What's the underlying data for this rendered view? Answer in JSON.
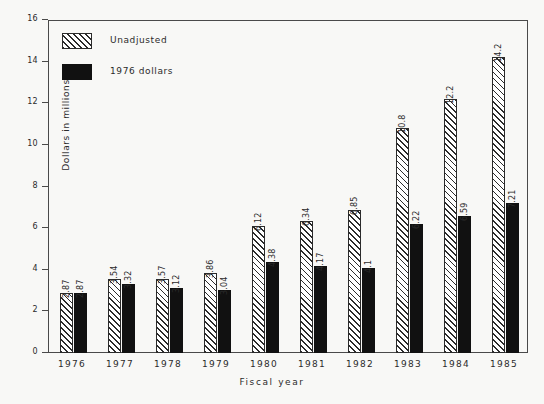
{
  "chart_data": {
    "type": "bar",
    "title": "",
    "xlabel": "Fiscal year",
    "ylabel": "Dollars in millions",
    "ylim": [
      0,
      16
    ],
    "yticks": [
      0,
      2,
      4,
      6,
      8,
      10,
      12,
      14,
      16
    ],
    "ytick_labels": [
      "0",
      "2",
      "4",
      "6",
      "8",
      "10",
      "12",
      "14",
      "16"
    ],
    "grid": false,
    "legend_position": "top-left",
    "categories": [
      "1976",
      "1977",
      "1978",
      "1979",
      "1980",
      "1981",
      "1982",
      "1983",
      "1984",
      "1985"
    ],
    "series": [
      {
        "name": "Unadjusted",
        "color": "#ffffff",
        "pattern": "diagonal-hatch",
        "values": [
          2.87,
          3.54,
          3.57,
          3.86,
          6.12,
          6.34,
          6.85,
          10.8,
          12.2,
          14.2
        ],
        "labels": [
          "2.87",
          "3.54",
          "3.57",
          "3.86",
          "6.12",
          "6.34",
          "6.85",
          "10.8",
          "12.2",
          "14.2"
        ]
      },
      {
        "name": "1976 dollars",
        "color": "#111111",
        "pattern": "solid",
        "values": [
          2.87,
          3.32,
          3.12,
          3.04,
          4.38,
          4.17,
          4.1,
          6.22,
          6.59,
          7.21
        ],
        "labels": [
          "2.87",
          "3.32",
          "3.12",
          "3.04",
          "4.38",
          "4.17",
          "4.1",
          "6.22",
          "6.59",
          "7.21"
        ]
      }
    ]
  },
  "legend": {
    "items": [
      {
        "label": "Unadjusted",
        "swatch": "hatched-square-icon"
      },
      {
        "label": "1976 dollars",
        "swatch": "filled-square-icon"
      }
    ]
  }
}
